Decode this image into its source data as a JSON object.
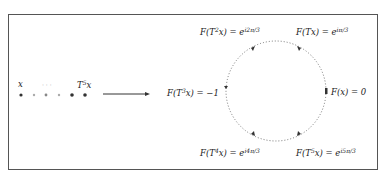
{
  "diagram": {
    "sequence": {
      "first_label": "x",
      "ellipsis": "· · ·",
      "last_label_base": "T",
      "last_label_exp": "5",
      "last_label_var": "x",
      "points": 6
    },
    "arrow": {
      "direction": "right"
    },
    "circle": {
      "style": "dotted",
      "points": [
        {
          "id": "Fx",
          "text": "F(x) = 0"
        },
        {
          "id": "FTx",
          "text_pre": "F(Tx) = e",
          "exp": "iπ/3"
        },
        {
          "id": "FT2x",
          "text_pre": "F(T",
          "pow": "2",
          "text_mid": "x) = e",
          "exp": "i2π/3"
        },
        {
          "id": "FT3x",
          "text_pre": "F(T",
          "pow": "3",
          "text_mid": "x) = −1"
        },
        {
          "id": "FT4x",
          "text_pre": "F(T",
          "pow": "4",
          "text_mid": "x) = e",
          "exp": "i4π/3"
        },
        {
          "id": "FT5x",
          "text_pre": "F(T",
          "pow": "5",
          "text_mid": "x) = e",
          "exp": "i5π/3"
        }
      ]
    },
    "colors": {
      "stroke": "#333333",
      "dots": "#555555",
      "faint": "#aaaaaa",
      "frame": "#555555"
    }
  }
}
